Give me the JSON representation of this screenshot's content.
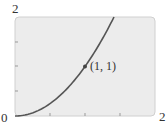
{
  "chart_data": {
    "type": "line",
    "title": "",
    "xlabel": "",
    "ylabel": "",
    "function": "y = x^2",
    "xlim": [
      0,
      2
    ],
    "ylim": [
      0,
      2
    ],
    "x_tick_labels": [
      "0",
      "2"
    ],
    "y_tick_labels": [
      "2"
    ],
    "x_minor_ticks": [
      0.5,
      1,
      1.5
    ],
    "y_minor_ticks": [
      0.5,
      1,
      1.5
    ],
    "grid": false,
    "series": [
      {
        "name": "y = x^2",
        "x": [
          0,
          0.25,
          0.5,
          0.75,
          1,
          1.25,
          1.414
        ],
        "y": [
          0,
          0.0625,
          0.25,
          0.5625,
          1,
          1.5625,
          2
        ]
      }
    ],
    "annotations": [
      {
        "text": "(1, 1)",
        "x": 1,
        "y": 1,
        "marker": true
      }
    ],
    "colors": {
      "curve": "#555555",
      "background": "#ececec",
      "frame": "#cccccc"
    }
  },
  "labels": {
    "y_top": "2",
    "origin": "0",
    "x_right": "2",
    "point": "(1, 1)"
  }
}
